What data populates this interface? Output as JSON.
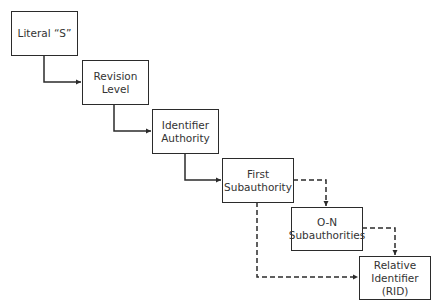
{
  "diagram": {
    "type": "flow",
    "nodes": [
      {
        "id": "literal_s",
        "lines": [
          "Literal “S”"
        ]
      },
      {
        "id": "revision_level",
        "lines": [
          "Revision",
          "Level"
        ]
      },
      {
        "id": "identifier_authority",
        "lines": [
          "Identifier",
          "Authority"
        ]
      },
      {
        "id": "first_subauthority",
        "lines": [
          "First",
          "Subauthority"
        ]
      },
      {
        "id": "on_subauthorities",
        "lines": [
          "O-N",
          "Subauthorities"
        ]
      },
      {
        "id": "rid",
        "lines": [
          "Relative",
          "Identifier",
          "(RID)"
        ]
      }
    ],
    "edges": [
      {
        "from": "literal_s",
        "to": "revision_level",
        "style": "solid"
      },
      {
        "from": "revision_level",
        "to": "identifier_authority",
        "style": "solid"
      },
      {
        "from": "identifier_authority",
        "to": "first_subauthority",
        "style": "solid"
      },
      {
        "from": "first_subauthority",
        "to": "on_subauthorities",
        "style": "dashed"
      },
      {
        "from": "on_subauthorities",
        "to": "rid",
        "style": "dashed"
      },
      {
        "from": "first_subauthority",
        "to": "rid",
        "style": "dashed"
      }
    ],
    "colors": {
      "stroke": "#2b2b2b",
      "text": "#333333",
      "background": "#ffffff"
    }
  }
}
